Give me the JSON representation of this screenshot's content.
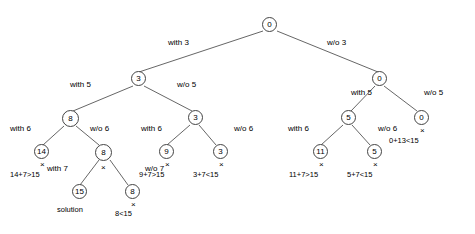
{
  "diagram": {
    "nodes": [
      {
        "id": "root",
        "label": "0",
        "x": 262,
        "y": 17,
        "size": "small"
      },
      {
        "id": "n3",
        "label": "3",
        "x": 131,
        "y": 71,
        "size": "small"
      },
      {
        "id": "n0r",
        "label": "0",
        "x": 372,
        "y": 71,
        "size": "small"
      },
      {
        "id": "n8",
        "label": "8",
        "x": 62,
        "y": 110,
        "size": "med"
      },
      {
        "id": "n3b",
        "label": "3",
        "x": 188,
        "y": 110,
        "size": "small"
      },
      {
        "id": "n5",
        "label": "5",
        "x": 341,
        "y": 110,
        "size": "small"
      },
      {
        "id": "n0rr",
        "label": "0",
        "x": 414,
        "y": 110,
        "size": "small"
      },
      {
        "id": "n14",
        "label": "14",
        "x": 34,
        "y": 144,
        "size": "small"
      },
      {
        "id": "n8b",
        "label": "8",
        "x": 95,
        "y": 144,
        "size": "med"
      },
      {
        "id": "n9",
        "label": "9",
        "x": 159,
        "y": 144,
        "size": "small"
      },
      {
        "id": "n3c",
        "label": "3",
        "x": 213,
        "y": 144,
        "size": "small"
      },
      {
        "id": "n11",
        "label": "11",
        "x": 313,
        "y": 144,
        "size": "small"
      },
      {
        "id": "n5b",
        "label": "5",
        "x": 367,
        "y": 144,
        "size": "small"
      },
      {
        "id": "n15",
        "label": "15",
        "x": 72,
        "y": 184,
        "size": "small"
      },
      {
        "id": "n8c",
        "label": "8",
        "x": 125,
        "y": 184,
        "size": "small"
      }
    ],
    "edge_labels": [
      {
        "id": "e-with-3",
        "text": "with 3",
        "x": 168,
        "y": 38
      },
      {
        "id": "e-wo-3",
        "text": "w/o 3",
        "x": 327,
        "y": 38
      },
      {
        "id": "e-with-5l",
        "text": "with 5",
        "x": 70,
        "y": 80
      },
      {
        "id": "e-wo-5l",
        "text": "w/o 5",
        "x": 177,
        "y": 80
      },
      {
        "id": "e-with-5r",
        "text": "with 5",
        "x": 351,
        "y": 88
      },
      {
        "id": "e-wo-5r",
        "text": "w/o 5",
        "x": 424,
        "y": 88
      },
      {
        "id": "e-with-6a",
        "text": "with 6",
        "x": 10,
        "y": 124
      },
      {
        "id": "e-wo-6a",
        "text": "w/o 6",
        "x": 90,
        "y": 124
      },
      {
        "id": "e-with-6b",
        "text": "with 6",
        "x": 141,
        "y": 124
      },
      {
        "id": "e-wo-6b",
        "text": "w/o 6",
        "x": 234,
        "y": 124
      },
      {
        "id": "e-with-6c",
        "text": "with 6",
        "x": 288,
        "y": 124
      },
      {
        "id": "e-wo-6c",
        "text": "w/o 6",
        "x": 378,
        "y": 124
      },
      {
        "id": "e-with-7",
        "text": "with 7",
        "x": 47,
        "y": 164
      },
      {
        "id": "e-wo-7",
        "text": "w/o 7",
        "x": 145,
        "y": 164
      }
    ],
    "x_marks": [
      {
        "id": "x-14",
        "x": 40,
        "y": 160
      },
      {
        "id": "x-9",
        "x": 165,
        "y": 160
      },
      {
        "id": "x-3c",
        "x": 219,
        "y": 160
      },
      {
        "id": "x-11",
        "x": 319,
        "y": 160
      },
      {
        "id": "x-5b",
        "x": 373,
        "y": 160
      },
      {
        "id": "x-0rr",
        "x": 420,
        "y": 126
      },
      {
        "id": "x-8b",
        "x": 101,
        "y": 163
      },
      {
        "id": "x-8c",
        "x": 131,
        "y": 200
      }
    ],
    "annotations": [
      {
        "id": "a-14",
        "text": "14+7>15",
        "x": 10,
        "y": 170
      },
      {
        "id": "a-9",
        "text": "9+7>15",
        "x": 139,
        "y": 170
      },
      {
        "id": "a-3c",
        "text": "3+7<15",
        "x": 193,
        "y": 170
      },
      {
        "id": "a-11",
        "text": "11+7>15",
        "x": 289,
        "y": 170
      },
      {
        "id": "a-5b",
        "text": "5+7<15",
        "x": 347,
        "y": 170
      },
      {
        "id": "a-0rr",
        "text": "0+13<15",
        "x": 389,
        "y": 136
      },
      {
        "id": "a-15",
        "text": "solution",
        "x": 57,
        "y": 205
      },
      {
        "id": "a-8c",
        "text": "8<15",
        "x": 115,
        "y": 209
      }
    ]
  }
}
